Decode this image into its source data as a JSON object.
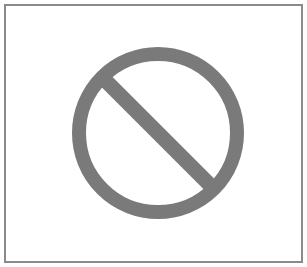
{
  "frame": {
    "border_color": "#8a8a8a",
    "background": "#ffffff"
  },
  "symbol": {
    "icon": "prohibited-icon",
    "color": "#7a7a7a",
    "center": [
      158,
      133
    ],
    "outer_radius": 86,
    "stroke_width": 14
  }
}
